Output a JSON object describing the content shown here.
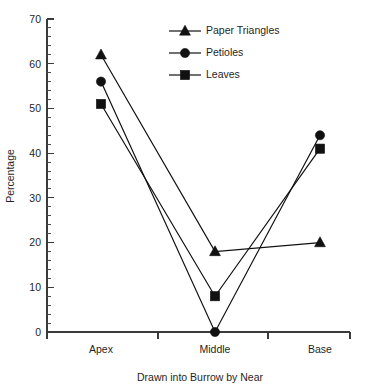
{
  "chart_data": {
    "type": "line",
    "title": "",
    "xlabel": "Drawn into Burrow by Near",
    "ylabel": "Percentage",
    "categories": [
      "Apex",
      "Middle",
      "Base"
    ],
    "ylim": [
      0,
      70
    ],
    "yticks": [
      0,
      10,
      20,
      30,
      40,
      50,
      60,
      70
    ],
    "ytick_labels": [
      "0",
      "10",
      "20",
      "30",
      "40",
      "50",
      "60",
      "70"
    ],
    "minor_tick_interval": 2,
    "grid": false,
    "legend_position": "top-right",
    "series": [
      {
        "name": "Paper Triangles",
        "marker": "triangle",
        "color": "#111111",
        "values": [
          62,
          18,
          20
        ]
      },
      {
        "name": "Petioles",
        "marker": "circle",
        "color": "#111111",
        "values": [
          56,
          0,
          44
        ]
      },
      {
        "name": "Leaves",
        "marker": "square",
        "color": "#111111",
        "values": [
          51,
          8,
          41
        ]
      }
    ]
  },
  "legend": {
    "entries": [
      {
        "label": "Paper Triangles",
        "marker": "triangle-icon"
      },
      {
        "label": "Petioles",
        "marker": "circle-icon"
      },
      {
        "label": "Leaves",
        "marker": "square-icon"
      }
    ]
  },
  "axes": {
    "y_title": "Percentage",
    "x_title": "Drawn into Burrow by Near",
    "y_labels": [
      "70",
      "60",
      "50",
      "40",
      "30",
      "20",
      "10",
      "0"
    ],
    "x_labels": [
      "Apex",
      "Middle",
      "Base"
    ]
  }
}
